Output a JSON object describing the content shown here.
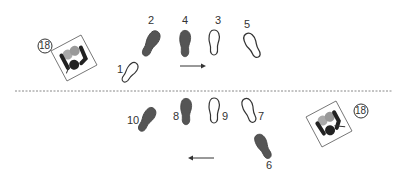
{
  "diagram": {
    "colors": {
      "filled": "#555555",
      "outline": "#333333",
      "line": "#888888",
      "arrow": "#333333"
    },
    "upper_row": {
      "direction": "right",
      "steps": [
        {
          "n": "1",
          "type": "outline"
        },
        {
          "n": "2",
          "type": "filled"
        },
        {
          "n": "4",
          "type": "filled"
        },
        {
          "n": "3",
          "type": "outline"
        },
        {
          "n": "5",
          "type": "outline"
        }
      ],
      "badge": "18"
    },
    "lower_row": {
      "direction": "left",
      "steps": [
        {
          "n": "10",
          "type": "filled"
        },
        {
          "n": "8",
          "type": "filled"
        },
        {
          "n": "9",
          "type": "outline"
        },
        {
          "n": "7",
          "type": "outline"
        },
        {
          "n": "6",
          "type": "filled"
        }
      ],
      "badge": "18"
    }
  }
}
